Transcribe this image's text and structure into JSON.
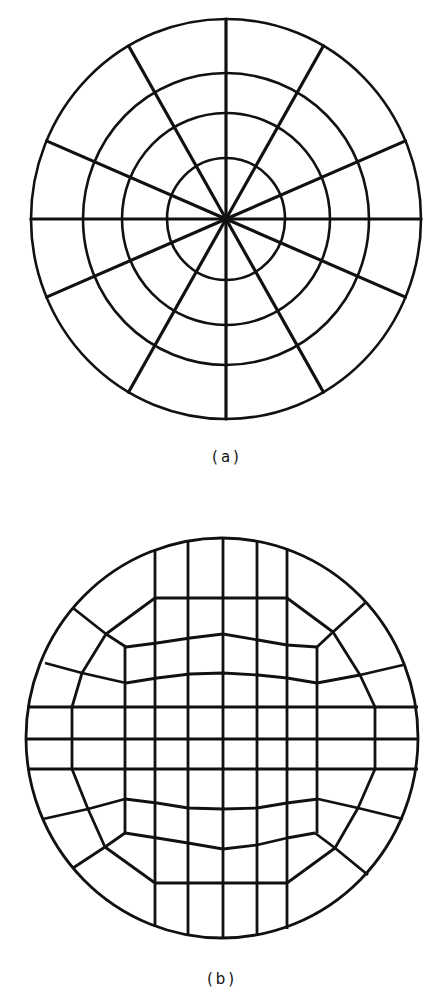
{
  "figure": {
    "stroke_color": "#111111",
    "background": "#ffffff",
    "panels": [
      {
        "id": "a",
        "caption": "(a)",
        "description": "Polar mesh: concentric rings with radial spokes",
        "center": [
          226,
          219
        ],
        "rings": [
          {
            "rx": 195,
            "ry": 200
          },
          {
            "rx": 143,
            "ry": 146
          },
          {
            "rx": 104,
            "ry": 106
          },
          {
            "rx": 59,
            "ry": 61
          }
        ],
        "spoke_angles_deg": [
          0,
          23,
          60,
          90,
          120,
          157,
          180,
          203,
          240,
          270,
          300,
          337
        ],
        "ring_stroke": 2.6,
        "spoke_stroke": 3.2
      },
      {
        "id": "b",
        "caption": "(b)",
        "description": "Structured grid mapped to a disk (O-grid style) with rectangular core",
        "center": [
          222,
          738
        ],
        "boundary": {
          "rx": 196,
          "ry": 200
        },
        "stroke": 2.8,
        "polylines": [
          [
            [
              155,
              551
            ],
            [
              155,
              927
            ]
          ],
          [
            [
              188,
              541
            ],
            [
              188,
              936
            ]
          ],
          [
            [
              223,
              538
            ],
            [
              223,
              938
            ]
          ],
          [
            [
              257,
              541
            ],
            [
              257,
              936
            ]
          ],
          [
            [
              287,
              548
            ],
            [
              287,
              929
            ]
          ],
          [
            [
              125,
              647
            ],
            [
              125,
              833
            ]
          ],
          [
            [
              317,
              647
            ],
            [
              317,
              833
            ]
          ],
          [
            [
              72,
              707
            ],
            [
              72,
              769
            ]
          ],
          [
            [
              375,
              707
            ],
            [
              375,
              769
            ]
          ],
          [
            [
              27,
              707
            ],
            [
              418,
              707
            ]
          ],
          [
            [
              26,
              739
            ],
            [
              419,
              739
            ]
          ],
          [
            [
              27,
              769
            ],
            [
              418,
              769
            ]
          ],
          [
            [
              155,
              598
            ],
            [
              287,
              598
            ]
          ],
          [
            [
              155,
              883
            ],
            [
              287,
              883
            ]
          ],
          [
            [
              126,
              647
            ],
            [
              157,
              643
            ],
            [
              190,
              638
            ],
            [
              223,
              634
            ],
            [
              258,
              640
            ],
            [
              287,
              645
            ],
            [
              317,
              647
            ]
          ],
          [
            [
              126,
              683
            ],
            [
              157,
              678
            ],
            [
              190,
              674
            ],
            [
              223,
              673
            ],
            [
              258,
              675
            ],
            [
              287,
              678
            ],
            [
              317,
              683
            ]
          ],
          [
            [
              125,
              799
            ],
            [
              157,
              803
            ],
            [
              188,
              808
            ],
            [
              223,
              809
            ],
            [
              257,
              808
            ],
            [
              287,
              803
            ],
            [
              318,
              799
            ]
          ],
          [
            [
              125,
              833
            ],
            [
              157,
              838
            ],
            [
              188,
              843
            ],
            [
              223,
              849
            ],
            [
              257,
              845
            ],
            [
              287,
              838
            ],
            [
              315,
              833
            ]
          ],
          [
            [
              73,
              608
            ],
            [
              106,
              634
            ],
            [
              126,
              647
            ]
          ],
          [
            [
              106,
              634
            ],
            [
              155,
              598
            ]
          ],
          [
            [
              106,
              634
            ],
            [
              82,
              673
            ],
            [
              72,
              707
            ]
          ],
          [
            [
              45,
              663
            ],
            [
              82,
              673
            ],
            [
              126,
              683
            ]
          ],
          [
            [
              365,
              603
            ],
            [
              333,
              632
            ],
            [
              317,
              647
            ]
          ],
          [
            [
              287,
              598
            ],
            [
              333,
              632
            ]
          ],
          [
            [
              333,
              632
            ],
            [
              360,
              675
            ],
            [
              375,
              707
            ]
          ],
          [
            [
              317,
              683
            ],
            [
              360,
              675
            ],
            [
              403,
              665
            ]
          ],
          [
            [
              72,
              769
            ],
            [
              88,
              809
            ],
            [
              105,
              847
            ]
          ],
          [
            [
              43,
              819
            ],
            [
              88,
              809
            ],
            [
              125,
              799
            ]
          ],
          [
            [
              73,
              868
            ],
            [
              105,
              847
            ],
            [
              125,
              833
            ]
          ],
          [
            [
              105,
              847
            ],
            [
              155,
              883
            ]
          ],
          [
            [
              375,
              769
            ],
            [
              358,
              808
            ],
            [
              335,
              848
            ]
          ],
          [
            [
              403,
              819
            ],
            [
              358,
              808
            ],
            [
              318,
              799
            ]
          ],
          [
            [
              368,
              875
            ],
            [
              335,
              848
            ],
            [
              315,
              833
            ]
          ],
          [
            [
              335,
              848
            ],
            [
              287,
              883
            ]
          ]
        ]
      }
    ]
  }
}
